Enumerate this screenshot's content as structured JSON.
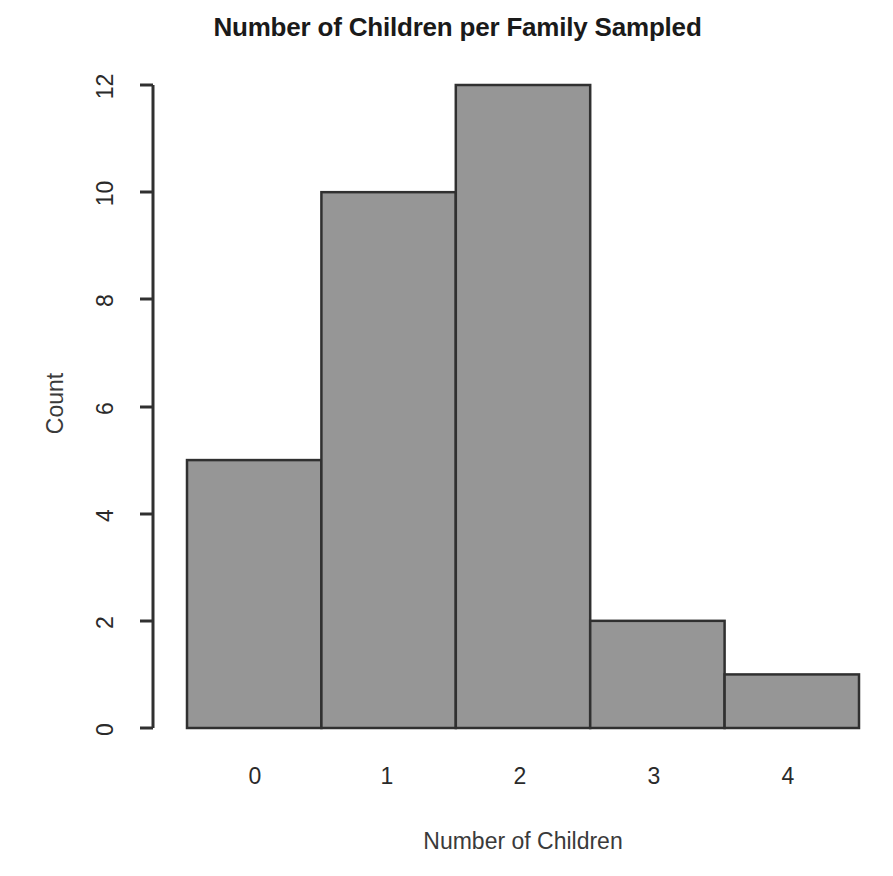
{
  "chart_data": {
    "type": "bar",
    "title": "Number of Children per Family Sampled",
    "xlabel": "Number of Children",
    "ylabel": "Count",
    "categories": [
      "0",
      "1",
      "2",
      "3",
      "4"
    ],
    "values": [
      5,
      10,
      12,
      2,
      1
    ],
    "x_tick_labels": [
      "0",
      "1",
      "2",
      "3",
      "4"
    ],
    "y_tick_labels": [
      "0",
      "2",
      "4",
      "6",
      "8",
      "10",
      "12"
    ],
    "y_ticks": [
      0,
      2,
      4,
      6,
      8,
      10,
      12
    ],
    "ylim": [
      0,
      12
    ],
    "xlim": [
      -0.5,
      4.5
    ],
    "grid": false,
    "legend": false,
    "bar_fill_color": "#969696",
    "bar_border_color": "#303030",
    "axis_color": "#303030",
    "background_color": "#ffffff",
    "style": "histogram, adjacent bars, no gaps, no x-axis line or ticks"
  }
}
